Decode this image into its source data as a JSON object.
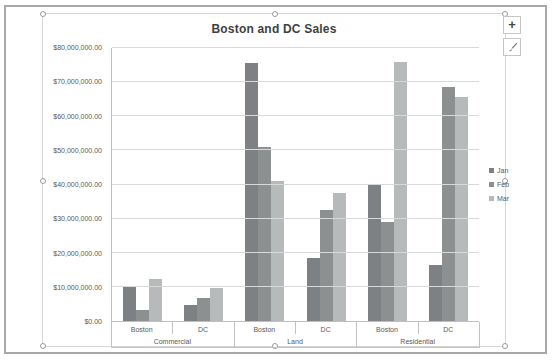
{
  "ui": {
    "chart_buttons": {
      "elements_glyph": "+",
      "styles_icon": "paintbrush-icon"
    }
  },
  "chart_data": {
    "type": "bar",
    "title": "Boston and DC Sales",
    "groups": [
      {
        "label": "Commercial",
        "subcategories": [
          "Boston",
          "DC"
        ]
      },
      {
        "label": "Land",
        "subcategories": [
          "Boston",
          "DC"
        ]
      },
      {
        "label": "Residential",
        "subcategories": [
          "Boston",
          "DC"
        ]
      }
    ],
    "series": [
      {
        "name": "Jan",
        "color": "#7e8183",
        "values": [
          10000000,
          4800000,
          75500000,
          18500000,
          40000000,
          16500000
        ]
      },
      {
        "name": "Feb",
        "color": "#8d9091",
        "values": [
          3200000,
          6800000,
          51000000,
          32500000,
          29000000,
          68500000
        ]
      },
      {
        "name": "Mar",
        "color": "#b6babb",
        "values": [
          12200000,
          9600000,
          41000000,
          37500000,
          76000000,
          65500000
        ]
      }
    ],
    "ylim": [
      0,
      80000000
    ],
    "ytick_step": 10000000,
    "ytick_labels": [
      "$0.00",
      "$10,000,000.00",
      "$20,000,000.00",
      "$30,000,000.00",
      "$40,000,000.00",
      "$50,000,000.00",
      "$60,000,000.00",
      "$70,000,000.00",
      "$80,000,000.00"
    ],
    "legend_position": "right",
    "grid": true
  }
}
